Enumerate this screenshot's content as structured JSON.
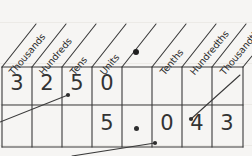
{
  "diagram": {
    "ink_color": "#333333",
    "background_color": "#f6f5f3",
    "columns": [
      {
        "label": "Thousands",
        "key": "thousands"
      },
      {
        "label": "Hundreds",
        "key": "hundreds"
      },
      {
        "label": "Tens",
        "key": "tens"
      },
      {
        "label": "Units",
        "key": "units"
      },
      {
        "label": "",
        "key": "decimal-point"
      },
      {
        "label": "Tenths",
        "key": "tenths"
      },
      {
        "label": "Hundredths",
        "key": "hundredths"
      },
      {
        "label": "Thousandths",
        "key": "thousandths"
      }
    ],
    "header_decimal_marker": "•",
    "rows": [
      {
        "name": "row-one",
        "number": "3250",
        "cells": [
          "3",
          "2",
          "5",
          "0",
          "",
          "",
          "",
          ""
        ]
      },
      {
        "name": "row-two",
        "number": "5.043",
        "cells": [
          "",
          "",
          "",
          "5",
          "•",
          "0",
          "4",
          "3"
        ]
      }
    ],
    "pointers": [
      {
        "name": "pointer-to-row-one-units",
        "target": "5 in Tens column"
      },
      {
        "name": "pointer-to-row-two-tenths",
        "target": "0 in Tenths column"
      },
      {
        "name": "pointer-to-row-two-hundredths",
        "target": "4 in Hundredths column"
      }
    ]
  }
}
